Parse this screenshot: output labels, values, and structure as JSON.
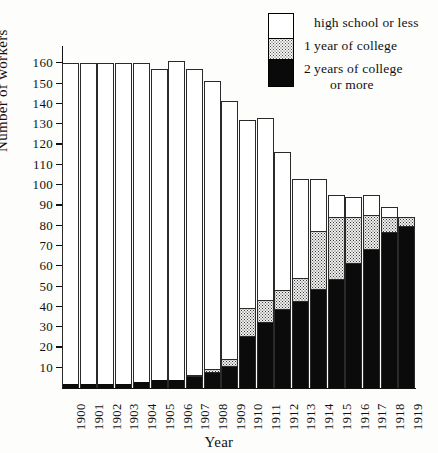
{
  "legend": {
    "items": [
      {
        "num": "",
        "label": "high school or less",
        "swatch": "white"
      },
      {
        "num": "1",
        "label": "year of college",
        "swatch": "dotted"
      },
      {
        "num": "2",
        "label": "years of college",
        "swatch": "black"
      }
    ],
    "continuation": "or more"
  },
  "axes": {
    "y_title": "Number of workers",
    "x_title": "Year",
    "y_ticks": [
      160,
      150,
      140,
      130,
      120,
      110,
      100,
      90,
      80,
      70,
      60,
      50,
      40,
      30,
      20,
      10
    ]
  },
  "chart_data": {
    "type": "bar",
    "subtype": "stacked",
    "title": "",
    "xlabel": "Year",
    "ylabel": "Number of workers",
    "ylim": [
      0,
      168
    ],
    "ytick_step": 10,
    "grid": false,
    "legend_position": "top-right",
    "categories": [
      "1900",
      "1901",
      "1902",
      "1903",
      "1904",
      "1905",
      "1906",
      "1907",
      "1908",
      "1909",
      "1910",
      "1911",
      "1912",
      "1913",
      "1914",
      "1915",
      "1916",
      "1917",
      "1918",
      "1919"
    ],
    "series": [
      {
        "name": "2 years of college or more",
        "swatch": "black",
        "color": "#0b0b0b",
        "values": [
          2,
          2,
          2,
          2,
          3,
          4,
          4,
          5,
          7,
          10,
          25,
          32,
          38,
          42,
          48,
          53,
          61,
          68,
          76,
          79
        ]
      },
      {
        "name": "1 year of college",
        "swatch": "dotted",
        "color": "#eeeeec",
        "values": [
          0,
          0,
          0,
          0,
          0,
          0,
          0,
          1,
          2,
          4,
          14,
          11,
          10,
          12,
          29,
          31,
          23,
          17,
          8,
          5
        ]
      },
      {
        "name": "high school or less",
        "swatch": "white",
        "color": "#ffffff",
        "values": [
          158,
          158,
          158,
          158,
          157,
          153,
          157,
          151,
          142,
          127,
          93,
          90,
          68,
          49,
          26,
          11,
          10,
          10,
          5,
          0
        ]
      }
    ],
    "totals": [
      160,
      160,
      160,
      160,
      160,
      157,
      161,
      157,
      151,
      141,
      132,
      133,
      116,
      103,
      103,
      95,
      94,
      95,
      89,
      84
    ]
  }
}
